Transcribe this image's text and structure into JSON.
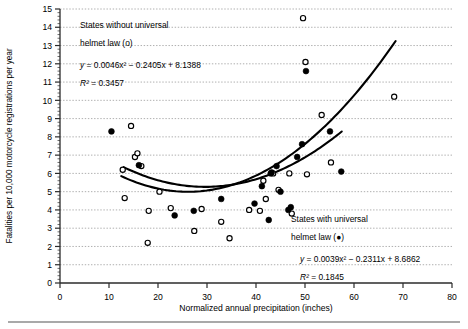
{
  "chart_data": {
    "type": "scatter",
    "title": "",
    "xlabel": "Normalized annual precipitation (inches)",
    "ylabel": "Fatalities per 10,000 motorcycle registrations per year",
    "xlim": [
      0,
      80
    ],
    "ylim": [
      0,
      15
    ],
    "xticks": [
      0,
      10,
      20,
      30,
      40,
      50,
      60,
      70,
      80
    ],
    "yticks": [
      0,
      1,
      2,
      3,
      4,
      5,
      6,
      7,
      8,
      9,
      10,
      11,
      12,
      13,
      14,
      15
    ],
    "grid": "horizontal-dotted",
    "legend_position": "in-plot",
    "series": [
      {
        "name": "States without universal helmet law (o)",
        "marker": "open-circle",
        "points": [
          [
            12.8,
            6.2
          ],
          [
            13.2,
            4.65
          ],
          [
            14.5,
            8.6
          ],
          [
            15.3,
            6.9
          ],
          [
            15.8,
            7.1
          ],
          [
            16.6,
            6.4
          ],
          [
            17.9,
            2.2
          ],
          [
            18.1,
            3.95
          ],
          [
            20.3,
            5.0
          ],
          [
            22.6,
            4.1
          ],
          [
            27.4,
            2.85
          ],
          [
            28.9,
            4.05
          ],
          [
            32.9,
            3.35
          ],
          [
            34.6,
            2.45
          ],
          [
            38.6,
            4.0
          ],
          [
            40.8,
            3.95
          ],
          [
            41.5,
            5.6
          ],
          [
            42.0,
            4.6
          ],
          [
            43.5,
            6.0
          ],
          [
            44.6,
            5.1
          ],
          [
            46.8,
            6.0
          ],
          [
            47.3,
            3.8
          ],
          [
            49.6,
            14.5
          ],
          [
            50.1,
            12.1
          ],
          [
            50.4,
            5.95
          ],
          [
            53.4,
            9.2
          ],
          [
            55.3,
            6.6
          ],
          [
            68.2,
            10.2
          ]
        ],
        "fit": {
          "equation_display": "y = 0.0046x² − 0.2405x + 8.1388",
          "r2_display": "R² = 0.3457",
          "a": 0.0046,
          "b": -0.2405,
          "c": 8.1388,
          "r2": 0.3457,
          "x_range": [
            12.5,
            68.5
          ]
        }
      },
      {
        "name": "States with universal helmet law (●)",
        "marker": "filled-circle",
        "points": [
          [
            10.5,
            8.3
          ],
          [
            16.1,
            6.45
          ],
          [
            23.4,
            3.7
          ],
          [
            27.3,
            3.95
          ],
          [
            32.9,
            4.6
          ],
          [
            39.7,
            4.35
          ],
          [
            41.2,
            5.3
          ],
          [
            42.6,
            3.45
          ],
          [
            43.0,
            6.0
          ],
          [
            43.2,
            6.05
          ],
          [
            44.2,
            6.4
          ],
          [
            45.0,
            5.0
          ],
          [
            46.6,
            4.0
          ],
          [
            47.1,
            4.15
          ],
          [
            48.4,
            6.9
          ],
          [
            49.4,
            7.6
          ],
          [
            50.2,
            11.6
          ],
          [
            55.1,
            8.3
          ],
          [
            57.4,
            6.1
          ]
        ],
        "fit": {
          "equation_display": "y = 0.0039x² − 0.2311x + 8.6862",
          "r2_display": "R² = 0.1845",
          "a": 0.0039,
          "b": -0.2311,
          "c": 8.6862,
          "r2": 0.1845,
          "x_range": [
            13.0,
            57.5
          ]
        }
      }
    ],
    "annotations": [
      {
        "id": "legend-without",
        "line1": "States without universal",
        "line2": "helmet law (o)",
        "equation": "y = 0.0046x² − 0.2405x + 8.1388",
        "r2": "R² = 0.3457"
      },
      {
        "id": "legend-with",
        "line1": "States with universal",
        "line2": "helmet law (●)",
        "equation": "y = 0.0039x² − 0.2311x + 8.6862",
        "r2": "R² = 0.1845"
      }
    ]
  },
  "axes": {
    "x_title": "Normalized annual precipitation (inches)",
    "y_title": "Fatalities per 10,000 motorcycle registrations per year",
    "x_tick_labels": [
      "0",
      "10",
      "20",
      "30",
      "40",
      "50",
      "60",
      "70",
      "80"
    ],
    "y_tick_labels": [
      "0",
      "1",
      "2",
      "3",
      "4",
      "5",
      "6",
      "7",
      "8",
      "9",
      "10",
      "11",
      "12",
      "13",
      "14",
      "15"
    ]
  },
  "legend_blocks": {
    "without": {
      "line1": "States without universal",
      "line2": "helmet law (o)",
      "equation_y": "y",
      "equation_rest": " = 0.0046x² − 0.2405x + 8.1388",
      "r2_symbol": "R²",
      "r2_rest": " = 0.3457"
    },
    "with": {
      "line1": "States with universal",
      "line2": "helmet law (●)",
      "equation_y": "y",
      "equation_rest": " = 0.0039x² − 0.2311x + 8.6862",
      "r2_symbol": "R²",
      "r2_rest": " = 0.1845"
    }
  },
  "colors": {
    "ink": "#000000",
    "grid": "#9a9a9a",
    "axis": "#2b2b2b",
    "rule": "#8c8c8c",
    "background": "#ffffff"
  }
}
